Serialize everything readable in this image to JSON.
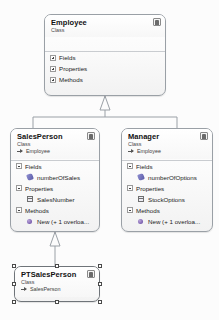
{
  "diagram": {
    "background_color": "#fcfcfc",
    "shape_border_color": "#9aa0a6",
    "connector_color": "#9aa0a6"
  },
  "classes": [
    {
      "id": "employee",
      "name": "Employee",
      "kind": "Class",
      "base": null,
      "selected": false,
      "badge_icon": "class-badge-icon",
      "sections": [
        {
          "label": "Fields",
          "expander": "plus",
          "expanded": false,
          "members": []
        },
        {
          "label": "Properties",
          "expander": "plus",
          "expanded": false,
          "members": []
        },
        {
          "label": "Methods",
          "expander": "plus",
          "expanded": false,
          "members": []
        }
      ]
    },
    {
      "id": "salesperson",
      "name": "SalesPerson",
      "kind": "Class",
      "base": "Employee",
      "selected": false,
      "badge_icon": "class-badge-icon",
      "sections": [
        {
          "label": "Fields",
          "expander": "minus",
          "expanded": true,
          "members": [
            {
              "name": "numberOfSales",
              "icon": "field-icon"
            }
          ]
        },
        {
          "label": "Properties",
          "expander": "minus",
          "expanded": true,
          "members": [
            {
              "name": "SalesNumber",
              "icon": "property-icon"
            }
          ]
        },
        {
          "label": "Methods",
          "expander": "minus",
          "expanded": true,
          "members": [
            {
              "name": "New (+ 1 overloa...",
              "icon": "method-icon"
            }
          ]
        }
      ]
    },
    {
      "id": "manager",
      "name": "Manager",
      "kind": "Class",
      "base": "Employee",
      "selected": false,
      "badge_icon": "class-badge-icon",
      "sections": [
        {
          "label": "Fields",
          "expander": "minus",
          "expanded": true,
          "members": [
            {
              "name": "numberOfOptions",
              "icon": "field-icon"
            }
          ]
        },
        {
          "label": "Properties",
          "expander": "minus",
          "expanded": true,
          "members": [
            {
              "name": "StockOptions",
              "icon": "property-icon"
            }
          ]
        },
        {
          "label": "Methods",
          "expander": "minus",
          "expanded": true,
          "members": [
            {
              "name": "New (+ 1 overloa...",
              "icon": "method-icon"
            }
          ]
        }
      ]
    },
    {
      "id": "ptsalesperson",
      "name": "PTSalesPerson",
      "kind": "Class",
      "base": "SalesPerson",
      "selected": true,
      "badge_icon": "class-badge-icon",
      "sections": []
    }
  ],
  "connectors": [
    {
      "from": "salesperson",
      "to": "employee",
      "type": "inheritance"
    },
    {
      "from": "manager",
      "to": "employee",
      "type": "inheritance"
    },
    {
      "from": "ptsalesperson",
      "to": "salesperson",
      "type": "inheritance"
    }
  ]
}
